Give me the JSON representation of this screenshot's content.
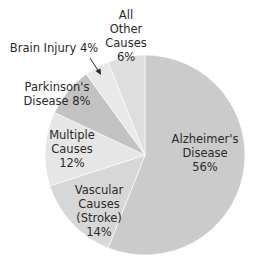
{
  "chart_data": {
    "type": "pie",
    "title": "",
    "start_angle_deg": 0,
    "direction": "clockwise",
    "slices": [
      {
        "key": "alzheimers",
        "name": "Alzheimer's Disease",
        "value": 56,
        "label_lines": [
          "Alzheimer's",
          "Disease",
          "56%"
        ],
        "color": "#cbcbcb"
      },
      {
        "key": "vascular",
        "name": "Vascular Causes (Stroke)",
        "value": 14,
        "label_lines": [
          "Vascular",
          "Causes",
          "(Stroke)",
          "14%"
        ],
        "color": "#d7d7d7"
      },
      {
        "key": "multiple",
        "name": "Multiple Causes",
        "value": 12,
        "label_lines": [
          "Multiple",
          "Causes",
          "12%"
        ],
        "color": "#e6e6e6"
      },
      {
        "key": "parkinsons",
        "name": "Parkinson's Disease",
        "value": 8,
        "label_lines": [
          "Parkinson's",
          "Disease 8%"
        ],
        "color": "#c2c2c2"
      },
      {
        "key": "brain_injury",
        "name": "Brain Injury",
        "value": 4,
        "label_lines": [
          "Brain Injury 4%"
        ],
        "color": "#e9e9e9"
      },
      {
        "key": "other",
        "name": "All Other Causes",
        "value": 6,
        "label_lines": [
          "All",
          "Other",
          "Causes",
          "6%"
        ],
        "color": "#dedede"
      }
    ],
    "legend": "none",
    "annotations": [
      {
        "text": "Brain Injury 4%",
        "arrow_to": "brain_injury"
      }
    ]
  }
}
